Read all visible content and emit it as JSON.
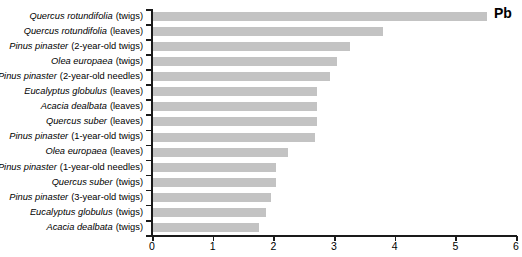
{
  "chart_data": {
    "type": "bar",
    "orientation": "horizontal",
    "title": "",
    "annotation": "Pb",
    "xlabel": "",
    "ylabel": "",
    "xlim": [
      0,
      6
    ],
    "grid": false,
    "legend": "none",
    "bar_color": "#c3c3c3",
    "axis_color": "#1a1a1a",
    "xticks": [
      "0",
      "1",
      "2",
      "3",
      "4",
      "5",
      "6"
    ],
    "xtick_values": [
      0,
      1,
      2,
      3,
      4,
      5,
      6
    ],
    "categories": [
      "Quercus rotundifolia (twigs)",
      "Quercus rotundifolia (leaves)",
      "Pinus pinaster (2-year-old twigs)",
      "Olea europaea (twigs)",
      "Pinus pinaster (2-year-old needles)",
      "Eucalyptus globulus (leaves)",
      "Acacia dealbata (leaves)",
      "Quercus suber (leaves)",
      "Pinus pinaster (1-year-old twigs)",
      "Olea europaea (leaves)",
      "Pinus pinaster (1-year-old needles)",
      "Quercus suber (twigs)",
      "Pinus pinaster (3-year-old twigs)",
      "Eucalyptus globulus (twigs)",
      "Acacia dealbata (twigs)"
    ],
    "category_parts": [
      {
        "species": "Quercus rotundifolia",
        "tissue": "(twigs)"
      },
      {
        "species": "Quercus rotundifolia",
        "tissue": "(leaves)"
      },
      {
        "species": "Pinus pinaster",
        "tissue": "(2-year-old twigs)"
      },
      {
        "species": "Olea europaea",
        "tissue": "(twigs)"
      },
      {
        "species": "Pinus pinaster",
        "tissue": "(2-year-old needles)"
      },
      {
        "species": "Eucalyptus globulus",
        "tissue": "(leaves)"
      },
      {
        "species": "Acacia dealbata",
        "tissue": "(leaves)"
      },
      {
        "species": "Quercus suber",
        "tissue": "(leaves)"
      },
      {
        "species": "Pinus pinaster",
        "tissue": "(1-year-old twigs)"
      },
      {
        "species": "Olea europaea",
        "tissue": "(leaves)"
      },
      {
        "species": "Pinus pinaster",
        "tissue": "(1-year-old needles)"
      },
      {
        "species": "Quercus suber",
        "tissue": "(twigs)"
      },
      {
        "species": "Pinus pinaster",
        "tissue": "(3-year-old twigs)"
      },
      {
        "species": "Eucalyptus globulus",
        "tissue": "(twigs)"
      },
      {
        "species": "Acacia dealbata",
        "tissue": "(twigs)"
      }
    ],
    "values": [
      5.52,
      3.81,
      3.26,
      3.05,
      2.93,
      2.72,
      2.72,
      2.72,
      2.68,
      2.24,
      2.04,
      2.04,
      1.96,
      1.88,
      1.76
    ]
  }
}
